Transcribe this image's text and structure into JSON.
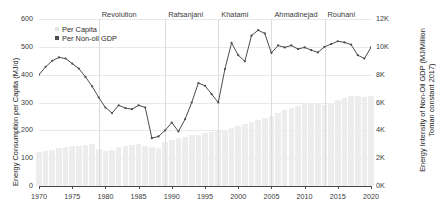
{
  "axes": {
    "left_title": "Energy Consumption per Capita (MJ/d)",
    "right_title_line1": "Energy Intensity of Non-Oil GDP (MJ/Million",
    "right_title_line2": "Toman constant 2017)",
    "y_left_ticks": [
      "0",
      "100",
      "200",
      "300",
      "400",
      "500",
      "600"
    ],
    "y_right_ticks": [
      "0K",
      "2K",
      "4K",
      "6K",
      "8K",
      "10K",
      "12K"
    ],
    "x_ticks": [
      "1970",
      "1975",
      "1980",
      "1985",
      "1990",
      "1995",
      "2000",
      "2005",
      "2010",
      "2015",
      "2020"
    ]
  },
  "legend": {
    "items": [
      {
        "label": "Per Capita",
        "color": "#e4e4e4",
        "swatch": "square-swatch"
      },
      {
        "label": "Per Non-oil GDP",
        "color": "#4d4d4d",
        "swatch": "square-swatch"
      }
    ]
  },
  "eras": [
    {
      "label": "Revolution",
      "year": 1979
    },
    {
      "label": "Rafsanjani",
      "year": 1989
    },
    {
      "label": "Khatami",
      "year": 1997
    },
    {
      "label": "Ahmadinejad",
      "year": 2005
    },
    {
      "label": "Rouhani",
      "year": 2013
    }
  ],
  "colors": {
    "bar": "#ededed",
    "line": "#4d4d4d",
    "grid": "#e9e9e9",
    "axis": "#4a4a4a",
    "era_divider": "#dcdcdc"
  },
  "chart_data": {
    "type": "line",
    "title": "",
    "xlabel": "",
    "ylabel": "Energy Consumption per Capita (MJ/d)",
    "y2label": "Energy Intensity of Non-Oil GDP (MJ/Million Toman constant 2017)",
    "xlim": [
      1970,
      2020
    ],
    "ylim": [
      0,
      600
    ],
    "y2lim": [
      0,
      12000
    ],
    "grid": true,
    "legend_position": "upper-left",
    "x": [
      1970,
      1971,
      1972,
      1973,
      1974,
      1975,
      1976,
      1977,
      1978,
      1979,
      1980,
      1981,
      1982,
      1983,
      1984,
      1985,
      1986,
      1987,
      1988,
      1989,
      1990,
      1991,
      1992,
      1993,
      1994,
      1995,
      1996,
      1997,
      1998,
      1999,
      2000,
      2001,
      2002,
      2003,
      2004,
      2005,
      2006,
      2007,
      2008,
      2009,
      2010,
      2011,
      2012,
      2013,
      2014,
      2015,
      2016,
      2017,
      2018,
      2019,
      2020
    ],
    "series": [
      {
        "name": "Per Capita",
        "axis": "right",
        "units": "MJ/Million Toman constant 2017",
        "type": "bar",
        "color": "#ededed",
        "values": [
          2450,
          2520,
          2600,
          2700,
          2780,
          2840,
          2900,
          2980,
          3020,
          2650,
          2500,
          2620,
          2780,
          2900,
          2950,
          3000,
          2900,
          2820,
          2760,
          3150,
          3300,
          3450,
          3550,
          3650,
          3700,
          3800,
          3900,
          3980,
          4050,
          4150,
          4300,
          4450,
          4600,
          4750,
          4900,
          5050,
          5250,
          5450,
          5600,
          5750,
          5900,
          6000,
          5900,
          5850,
          6000,
          6150,
          6350,
          6500,
          6450,
          6400,
          6500
        ]
      },
      {
        "name": "Per Non-oil GDP",
        "axis": "left",
        "units": "MJ/d",
        "type": "line",
        "color": "#4d4d4d",
        "values": [
          400,
          428,
          450,
          462,
          458,
          440,
          422,
          392,
          358,
          318,
          282,
          262,
          290,
          280,
          276,
          290,
          282,
          172,
          178,
          200,
          228,
          196,
          240,
          300,
          370,
          360,
          330,
          300,
          420,
          514,
          470,
          448,
          540,
          560,
          548,
          478,
          505,
          498,
          505,
          492,
          498,
          488,
          480,
          500,
          510,
          520,
          516,
          508,
          470,
          458,
          498
        ]
      }
    ]
  }
}
